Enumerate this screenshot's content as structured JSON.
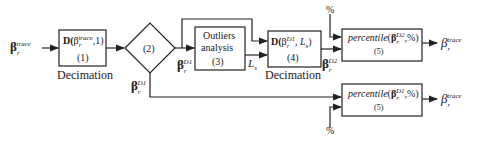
{
  "diagram": {
    "input": {
      "symbol": "β",
      "sub": "r",
      "sup": "trace"
    },
    "block1": {
      "func": "D(",
      "arg_symbol": "β",
      "arg_sub": "r",
      "arg_sup": "trace",
      "rest": ",1)",
      "number": "(1)",
      "caption": "Decimation"
    },
    "block2": {
      "number": "(2)",
      "out_right": {
        "symbol": "β",
        "sub": "r",
        "sup": "D1"
      },
      "out_bottom": {
        "symbol": "β",
        "sub": "r",
        "sup": "D1"
      }
    },
    "block3": {
      "line1": "Outliers",
      "line2": "analysis",
      "number": "(3)",
      "out_label": "L",
      "out_sub": "s"
    },
    "block4": {
      "func": "D(",
      "arg_symbol": "β",
      "arg_sub": "r",
      "arg_sup": "D1",
      "rest_a": ", ",
      "rest_L": "L",
      "rest_Lsub": "s",
      "rest_b": ")",
      "number": "(4)",
      "caption": "Decimation",
      "out": {
        "symbol": "β",
        "sub": "r",
        "sup": "D2"
      }
    },
    "block5a": {
      "func": "percentile",
      "arg_symbol": "β",
      "arg_sub": "r",
      "arg_sup": "D2",
      "rest": ",%)",
      "number": "(5)",
      "percent_input": "%",
      "output": {
        "symbol": "β",
        "sub": "r",
        "sup": "trace"
      }
    },
    "block5b": {
      "func": "percentile",
      "arg_symbol": "β",
      "arg_sub": "r",
      "arg_sup": "D1",
      "rest": ",%)",
      "number": "(5)",
      "percent_input": "%",
      "output": {
        "symbol": "β",
        "sub": "r",
        "sup": "trace"
      }
    }
  }
}
